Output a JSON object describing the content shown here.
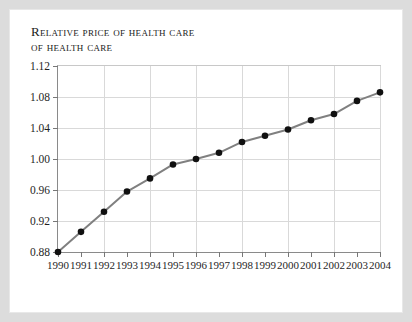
{
  "figure": {
    "title_line1": "Relative price",
    "title_line2": "of health care",
    "line_color": "#808080",
    "marker_color": "#101010",
    "grid_color": "#d9d9d9",
    "axis_color": "#8a8a8a",
    "page_background": "#ffffff",
    "outer_background": "#dcdcdc"
  },
  "chart_data": {
    "type": "line",
    "title": "Relative price of health care",
    "xlabel": "",
    "ylabel": "Relative price of health care",
    "grid": true,
    "legend": null,
    "xlim": [
      1990,
      2004
    ],
    "ylim": [
      0.88,
      1.12
    ],
    "ytick_labels": [
      "1.12",
      "1.08",
      "1.04",
      "1.00",
      "0.96",
      "0.92",
      "0.88"
    ],
    "ytick_values": [
      1.12,
      1.08,
      1.04,
      1.0,
      0.96,
      0.92,
      0.88
    ],
    "xtick_labels": [
      "1990",
      "1991",
      "1992",
      "1993",
      "1994",
      "1995",
      "1996",
      "1997",
      "1998",
      "1999",
      "2000",
      "2001",
      "2002",
      "2003",
      "2004"
    ],
    "categories": [
      1990,
      1991,
      1992,
      1993,
      1994,
      1995,
      1996,
      1997,
      1998,
      1999,
      2000,
      2001,
      2002,
      2003,
      2004
    ],
    "values": [
      0.88,
      0.906,
      0.932,
      0.958,
      0.975,
      0.993,
      1.0,
      1.008,
      1.022,
      1.03,
      1.038,
      1.05,
      1.058,
      1.075,
      1.086
    ],
    "series": [
      {
        "name": "Relative price of health care",
        "values": [
          0.88,
          0.906,
          0.932,
          0.958,
          0.975,
          0.993,
          1.0,
          1.008,
          1.022,
          1.03,
          1.038,
          1.05,
          1.058,
          1.075,
          1.086
        ]
      }
    ]
  }
}
